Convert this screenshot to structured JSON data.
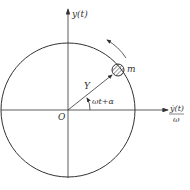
{
  "diagram": {
    "type": "phasor-rotating-vector",
    "labels": {
      "y_axis": "y(t)",
      "x_axis_numerator": "ẏ(t)",
      "x_axis_denominator": "ω",
      "origin": "O",
      "radius": "Y",
      "angle": "ωt+α",
      "mass": "m"
    },
    "geometry": {
      "center": [
        68,
        110
      ],
      "circle_radius": 68,
      "mass_position": [
        118,
        70
      ],
      "mass_radius": 6
    },
    "colors": {
      "stroke": "#333333",
      "background": "#ffffff"
    }
  }
}
